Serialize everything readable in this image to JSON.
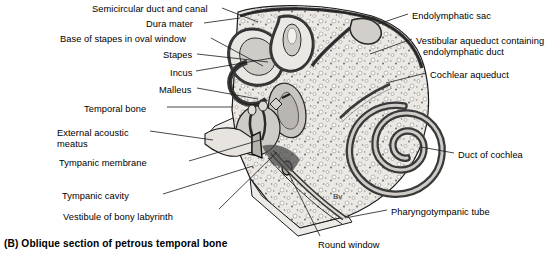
{
  "figure": {
    "caption": "(B) Oblique section of petrous temporal bone",
    "domain": "anatomical-illustration",
    "style": "grayscale line drawing with stipple bone texture"
  },
  "colors": {
    "background": "#ffffff",
    "text": "#000000",
    "leader_line": "#1a1a1a",
    "bone_fill": "#ece9e4",
    "bone_stipple": "#8d8d8d",
    "membrane_dark": "#3a3a3a",
    "duct_lumen": "#d8d5d0",
    "cavity_fill": "#c9c6c1",
    "outline": "#111111"
  },
  "labels_left": [
    {
      "id": "semicircular-duct-and-canal",
      "text": "Semicircular duct and canal",
      "x": 92,
      "y": 4
    },
    {
      "id": "dura-mater",
      "text": "Dura mater",
      "x": 146,
      "y": 19
    },
    {
      "id": "base-of-stapes-in-oval-window",
      "text": "Base of stapes in oval window",
      "x": 60,
      "y": 34
    },
    {
      "id": "stapes",
      "text": "Stapes",
      "x": 163,
      "y": 50
    },
    {
      "id": "incus",
      "text": "Incus",
      "x": 170,
      "y": 68
    },
    {
      "id": "malleus",
      "text": "Malleus",
      "x": 159,
      "y": 85
    },
    {
      "id": "temporal-bone",
      "text": "Temporal bone",
      "x": 84,
      "y": 104
    },
    {
      "id": "external-acoustic-meatus-line1",
      "text": "External acoustic",
      "x": 57,
      "y": 128
    },
    {
      "id": "external-acoustic-meatus-line2",
      "text": "meatus",
      "x": 57,
      "y": 139
    },
    {
      "id": "tympanic-membrane",
      "text": "Tympanic membrane",
      "x": 59,
      "y": 158
    },
    {
      "id": "tympanic-cavity",
      "text": "Tympanic cavity",
      "x": 62,
      "y": 191
    },
    {
      "id": "vestibule-of-bony-labyrinth",
      "text": "Vestibule of bony labyrinth",
      "x": 63,
      "y": 212
    }
  ],
  "labels_right": [
    {
      "id": "endolymphatic-sac",
      "text": "Endolymphatic sac",
      "x": 412,
      "y": 11
    },
    {
      "id": "vestibular-aqueduct-line1",
      "text": "Vestibular aqueduct containing",
      "x": 416,
      "y": 36
    },
    {
      "id": "vestibular-aqueduct-line2",
      "text": "endolymphatic duct",
      "x": 423,
      "y": 47
    },
    {
      "id": "cochlear-aqueduct",
      "text": "Cochlear aqueduct",
      "x": 430,
      "y": 70
    },
    {
      "id": "duct-of-cochlea",
      "text": "Duct of cochlea",
      "x": 458,
      "y": 150
    },
    {
      "id": "pharyngotympanic-tube",
      "text": "Pharyngotympanic tube",
      "x": 391,
      "y": 207
    },
    {
      "id": "round-window",
      "text": "Round window",
      "x": 318,
      "y": 240
    }
  ],
  "inline_annotations": [
    {
      "id": "bv",
      "text": "Bv",
      "x": 333,
      "y": 192
    }
  ],
  "leader_lines": [
    {
      "id": "leader-semicircular-duct-and-canal",
      "from": [
        222,
        8
      ],
      "to": [
        258,
        22
      ]
    },
    {
      "id": "leader-dura-mater",
      "from": [
        204,
        23
      ],
      "to": [
        240,
        18
      ]
    },
    {
      "id": "leader-base-of-stapes",
      "from": [
        211,
        38
      ],
      "to": [
        263,
        66
      ]
    },
    {
      "id": "leader-stapes",
      "from": [
        197,
        54
      ],
      "to": [
        268,
        62
      ]
    },
    {
      "id": "leader-incus",
      "from": [
        196,
        71
      ],
      "to": [
        272,
        58
      ]
    },
    {
      "id": "leader-malleus",
      "from": [
        197,
        88
      ],
      "to": [
        258,
        99
      ]
    },
    {
      "id": "leader-temporal-bone",
      "from": [
        167,
        107
      ],
      "to": [
        232,
        107
      ]
    },
    {
      "id": "leader-external-acoustic-meatus",
      "from": [
        150,
        131
      ],
      "to": [
        213,
        140
      ]
    },
    {
      "id": "leader-tympanic-membrane",
      "from": [
        189,
        161
      ],
      "to": [
        260,
        140
      ]
    },
    {
      "id": "leader-tympanic-cavity",
      "from": [
        163,
        194
      ],
      "to": [
        253,
        166
      ]
    },
    {
      "id": "leader-vestibule-of-bony-labyrinth",
      "from": [
        219,
        209
      ],
      "to": [
        277,
        152
      ]
    },
    {
      "id": "leader-endolymphatic-sac",
      "from": [
        408,
        14
      ],
      "to": [
        378,
        24
      ]
    },
    {
      "id": "leader-vestibular-aqueduct",
      "from": [
        412,
        39
      ],
      "to": [
        370,
        54
      ]
    },
    {
      "id": "leader-cochlear-aqueduct",
      "from": [
        426,
        73
      ],
      "to": [
        386,
        83
      ]
    },
    {
      "id": "leader-duct-of-cochlea",
      "from": [
        454,
        153
      ],
      "to": [
        421,
        147
      ]
    },
    {
      "id": "leader-pharyngotympanic-tube",
      "from": [
        387,
        210
      ],
      "to": [
        345,
        218
      ]
    },
    {
      "id": "leader-round-window",
      "from": [
        320,
        236
      ],
      "to": [
        288,
        172
      ]
    }
  ]
}
